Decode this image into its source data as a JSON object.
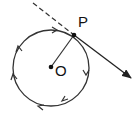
{
  "diagram": {
    "labels": {
      "center": "O",
      "point": "P"
    },
    "circle": {
      "cx": 51,
      "cy": 68,
      "r": 38,
      "direction": "clockwise"
    },
    "colors": {
      "stroke": "#222222",
      "background": "#ffffff"
    }
  }
}
